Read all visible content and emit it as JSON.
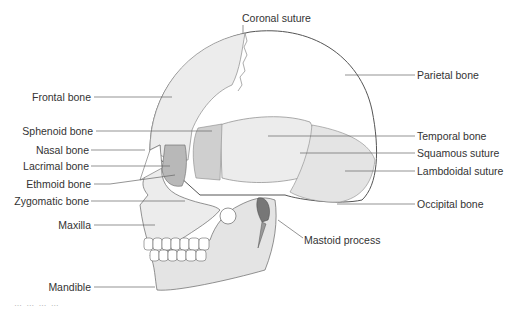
{
  "diagram": {
    "colors": {
      "bone_light": "#ececec",
      "bone_mid": "#dcdcdc",
      "bone_dark": "#c4c4c4",
      "outline": "#555555",
      "leader_line": "#666666",
      "text": "#333333"
    },
    "labels": {
      "coronal_suture": "Coronal suture",
      "parietal_bone": "Parietal bone",
      "frontal_bone": "Frontal bone",
      "sphenoid_bone": "Sphenoid bone",
      "temporal_bone": "Temporal bone",
      "nasal_bone": "Nasal bone",
      "squamous_suture": "Squamous suture",
      "lacrimal_bone": "Lacrimal bone",
      "lambdoidal_suture": "Lambdoidal suture",
      "ethmoid_bone": "Ethmoid bone",
      "zygomatic_bone": "Zygomatic bone",
      "occipital_bone": "Occipital bone",
      "maxilla": "Maxilla",
      "mastoid_process": "Mastoid process",
      "mandible": "Mandible"
    },
    "caption": "… … … …"
  }
}
